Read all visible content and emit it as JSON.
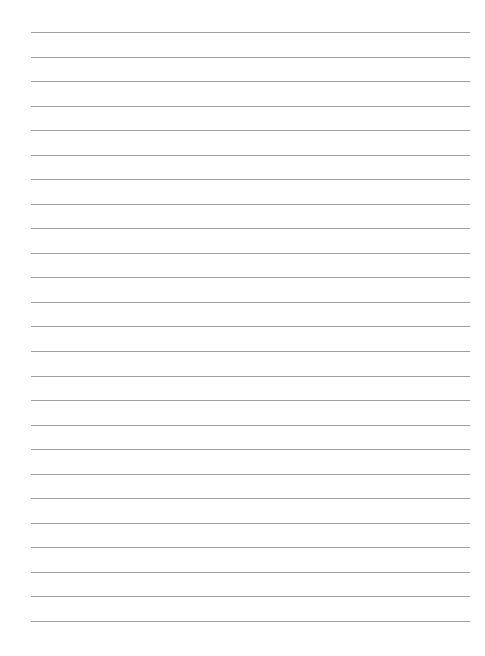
{
  "page": {
    "type": "lined-paper",
    "line_count": 25,
    "first_line_y": 32,
    "line_spacing": 24.54,
    "line_left": 31,
    "line_width": 439,
    "line_color": "#a0a0a0",
    "background": "#ffffff"
  }
}
